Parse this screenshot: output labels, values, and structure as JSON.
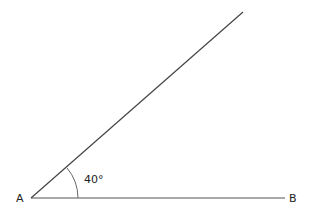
{
  "diagram": {
    "type": "angle",
    "vertex_label": "A",
    "end_label": "B",
    "angle_label": "40°",
    "angle_degrees": 40,
    "line_color": "#444444",
    "arc_color": "#666666"
  }
}
